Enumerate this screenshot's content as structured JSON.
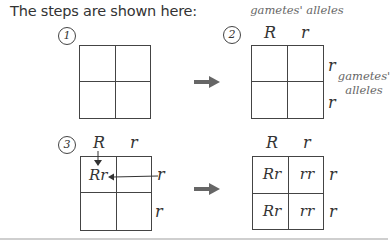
{
  "intro": "The steps are shown here:",
  "steps": [
    {
      "number": "1"
    },
    {
      "number": "2",
      "top_caption": "gametes' alleles",
      "side_caption_line1": "gametes'",
      "side_caption_line2": "alleles",
      "col_alleles": [
        "R",
        "r"
      ],
      "row_alleles": [
        "r",
        "r"
      ]
    },
    {
      "number": "3",
      "col_alleles": [
        "R",
        "r"
      ],
      "row_alleles": [
        "r",
        "r"
      ],
      "cells": [
        "Rr",
        "",
        "",
        ""
      ]
    },
    {
      "col_alleles": [
        "R",
        "r"
      ],
      "row_alleles": [
        "r",
        "r"
      ],
      "cells": [
        "Rr",
        "rr",
        "Rr",
        "rr"
      ]
    }
  ],
  "colors": {
    "line": "#444444",
    "arrow": "#666666",
    "caption": "#666666"
  }
}
